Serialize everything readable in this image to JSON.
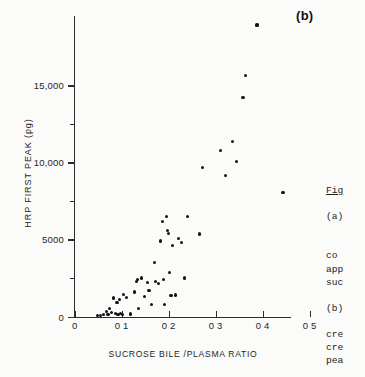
{
  "figure": {
    "panel_letter": "(b)",
    "x_axis": {
      "title": "SUCROSE BILE /PLASMA RATIO",
      "ticks": [
        {
          "value": 0,
          "label": "0"
        },
        {
          "value": 0.1,
          "label": "0 1"
        },
        {
          "value": 0.2,
          "label": "0 2"
        },
        {
          "value": 0.3,
          "label": "0 3"
        },
        {
          "value": 0.4,
          "label": "0 4"
        },
        {
          "value": 0.5,
          "label": "0 5"
        }
      ]
    },
    "y_axis": {
      "title": "HRP FIRST PEAK (pg)",
      "ticks": [
        {
          "value": 0,
          "label": "0"
        },
        {
          "value": 2500,
          "label": ""
        },
        {
          "value": 5000,
          "label": "5000"
        },
        {
          "value": 7500,
          "label": ""
        },
        {
          "value": 10000,
          "label": "10,000"
        },
        {
          "value": 12500,
          "label": ""
        },
        {
          "value": 15000,
          "label": "15,000"
        }
      ]
    }
  },
  "caption": {
    "lines": [
      "Fig",
      "",
      "(a)",
      "",
      "",
      "co",
      "app",
      "suc",
      "",
      "(b)",
      "",
      "cre",
      "cre",
      "pea"
    ]
  },
  "chart_data": {
    "type": "scatter",
    "title": "",
    "xlabel": "SUCROSE BILE /PLASMA RATIO",
    "ylabel": "HRP FIRST PEAK (pg)",
    "xlim": [
      0,
      0.5
    ],
    "ylim": [
      0,
      19500
    ],
    "grid": false,
    "legend": null,
    "marker": "filled-circle",
    "color": "#141414",
    "points": [
      {
        "x": 0.048,
        "y": 60
      },
      {
        "x": 0.055,
        "y": 80
      },
      {
        "x": 0.062,
        "y": 150
      },
      {
        "x": 0.068,
        "y": 330
      },
      {
        "x": 0.071,
        "y": 130
      },
      {
        "x": 0.074,
        "y": 520
      },
      {
        "x": 0.079,
        "y": 250
      },
      {
        "x": 0.083,
        "y": 1200
      },
      {
        "x": 0.086,
        "y": 200
      },
      {
        "x": 0.09,
        "y": 900
      },
      {
        "x": 0.092,
        "y": 130
      },
      {
        "x": 0.095,
        "y": 1100
      },
      {
        "x": 0.098,
        "y": 180
      },
      {
        "x": 0.102,
        "y": 120
      },
      {
        "x": 0.104,
        "y": 1450
      },
      {
        "x": 0.11,
        "y": 1250
      },
      {
        "x": 0.118,
        "y": 170
      },
      {
        "x": 0.128,
        "y": 1600
      },
      {
        "x": 0.131,
        "y": 2250
      },
      {
        "x": 0.134,
        "y": 2400
      },
      {
        "x": 0.136,
        "y": 540
      },
      {
        "x": 0.142,
        "y": 2500
      },
      {
        "x": 0.148,
        "y": 1300
      },
      {
        "x": 0.155,
        "y": 2200
      },
      {
        "x": 0.158,
        "y": 1700
      },
      {
        "x": 0.163,
        "y": 780
      },
      {
        "x": 0.17,
        "y": 3500
      },
      {
        "x": 0.172,
        "y": 2300
      },
      {
        "x": 0.178,
        "y": 2150
      },
      {
        "x": 0.182,
        "y": 4900
      },
      {
        "x": 0.186,
        "y": 6150
      },
      {
        "x": 0.189,
        "y": 2400
      },
      {
        "x": 0.191,
        "y": 810
      },
      {
        "x": 0.196,
        "y": 6500
      },
      {
        "x": 0.198,
        "y": 5600
      },
      {
        "x": 0.2,
        "y": 5400
      },
      {
        "x": 0.202,
        "y": 2850
      },
      {
        "x": 0.205,
        "y": 1350
      },
      {
        "x": 0.208,
        "y": 4600
      },
      {
        "x": 0.214,
        "y": 1400
      },
      {
        "x": 0.22,
        "y": 5050
      },
      {
        "x": 0.228,
        "y": 4800
      },
      {
        "x": 0.233,
        "y": 2500
      },
      {
        "x": 0.24,
        "y": 6500
      },
      {
        "x": 0.265,
        "y": 5350
      },
      {
        "x": 0.272,
        "y": 9650
      },
      {
        "x": 0.31,
        "y": 10750
      },
      {
        "x": 0.32,
        "y": 9150
      },
      {
        "x": 0.336,
        "y": 11350
      },
      {
        "x": 0.344,
        "y": 10050
      },
      {
        "x": 0.358,
        "y": 14200
      },
      {
        "x": 0.363,
        "y": 15650
      },
      {
        "x": 0.388,
        "y": 18900
      },
      {
        "x": 0.443,
        "y": 8050
      }
    ]
  }
}
